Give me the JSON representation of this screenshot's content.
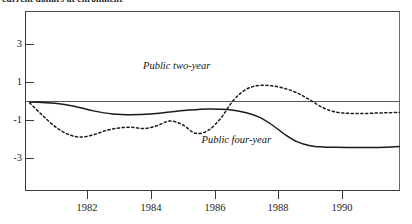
{
  "top_caption": "current dollars at enrollment",
  "chart_data": {
    "type": "line",
    "title": "",
    "xlabel": "",
    "ylabel": "",
    "grid": false,
    "legend": "inline-annotations",
    "xlim": [
      1980.2,
      1991.8
    ],
    "ylim": [
      -4.6,
      4.0
    ],
    "x_ticks": [
      1982,
      1984,
      1986,
      1988,
      1990
    ],
    "y_ticks": [
      3,
      1,
      -1,
      -3
    ],
    "zero_reference_line": 0,
    "series": [
      {
        "name": "Public two-year",
        "style": "dashed",
        "color": "#1b1b1b",
        "x": [
          1980.2,
          1980.6,
          1981.0,
          1981.4,
          1981.8,
          1982.2,
          1982.6,
          1983.0,
          1983.4,
          1983.8,
          1984.2,
          1984.6,
          1985.0,
          1985.4,
          1985.8,
          1986.2,
          1986.6,
          1987.0,
          1987.4,
          1987.8,
          1988.2,
          1988.6,
          1989.0,
          1989.4,
          1989.8,
          1990.2,
          1990.6,
          1991.0,
          1991.4,
          1991.8
        ],
        "values": [
          -0.1,
          -0.75,
          -1.35,
          -1.75,
          -1.9,
          -1.78,
          -1.55,
          -1.42,
          -1.38,
          -1.45,
          -1.3,
          -1.05,
          -1.25,
          -1.7,
          -1.55,
          -0.9,
          0.05,
          0.62,
          0.82,
          0.8,
          0.66,
          0.42,
          0.05,
          -0.35,
          -0.58,
          -0.65,
          -0.66,
          -0.64,
          -0.62,
          -0.6
        ]
      },
      {
        "name": "Public four-year",
        "style": "solid",
        "color": "#1b1b1b",
        "x": [
          1980.2,
          1980.6,
          1981.0,
          1981.6,
          1982.2,
          1982.8,
          1983.4,
          1984.0,
          1984.6,
          1985.2,
          1985.8,
          1986.4,
          1987.0,
          1987.4,
          1987.8,
          1988.2,
          1988.6,
          1989.0,
          1989.4,
          1989.8,
          1990.4,
          1991.0,
          1991.4,
          1991.8
        ],
        "values": [
          -0.05,
          -0.08,
          -0.12,
          -0.28,
          -0.52,
          -0.68,
          -0.72,
          -0.68,
          -0.58,
          -0.48,
          -0.42,
          -0.45,
          -0.62,
          -0.85,
          -1.25,
          -1.75,
          -2.15,
          -2.35,
          -2.42,
          -2.44,
          -2.45,
          -2.45,
          -2.43,
          -2.4
        ]
      }
    ],
    "annotations": [
      {
        "text": "Public two-year",
        "x": 1985.2,
        "y": 1.85
      },
      {
        "text": "Public four-year",
        "x": 1987.1,
        "y": -2.05
      }
    ]
  }
}
